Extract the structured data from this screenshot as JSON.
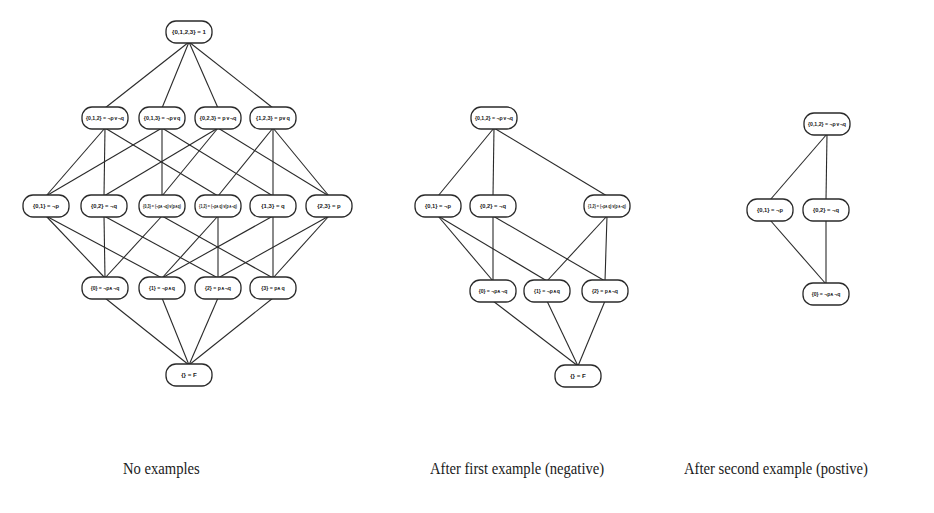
{
  "figure": {
    "captions": [
      {
        "id": "left",
        "text": "No examples",
        "x": 123
      },
      {
        "id": "middle",
        "text": "After first example (negative)",
        "x": 430
      },
      {
        "id": "right",
        "text": "After second example (postive)",
        "x": 684
      }
    ],
    "node_size": {
      "w": 46,
      "h": 22,
      "rx": 10
    },
    "graphs": [
      {
        "id": "no-examples",
        "nodes": [
          {
            "id": "s0123",
            "label": "{0,1,2,3} = 1",
            "x": 189,
            "y": 32
          },
          {
            "id": "s012",
            "label": "{0,1,2} = ¬p∨¬q",
            "x": 105,
            "y": 118
          },
          {
            "id": "s013",
            "label": "{0,1,3} = ¬p∨q",
            "x": 162,
            "y": 118
          },
          {
            "id": "s023",
            "label": "{0,2,3} = p∨¬q",
            "x": 218,
            "y": 118
          },
          {
            "id": "s123",
            "label": "{1,2,3} = p∨q",
            "x": 273,
            "y": 118
          },
          {
            "id": "s01",
            "label": "{0,1} = ¬p",
            "x": 46,
            "y": 206
          },
          {
            "id": "s02",
            "label": "{0,2} = ¬q",
            "x": 104,
            "y": 206
          },
          {
            "id": "s03",
            "label": "{0,3} = (¬p∧¬q)∨(p∧q)",
            "x": 162,
            "y": 206
          },
          {
            "id": "s12",
            "label": "{1,2} = (¬p∧q)∨(p∧¬q)",
            "x": 218,
            "y": 206
          },
          {
            "id": "s13",
            "label": "{1,3} = q",
            "x": 273,
            "y": 206
          },
          {
            "id": "s23",
            "label": "{2,3} = p",
            "x": 329,
            "y": 206
          },
          {
            "id": "s0",
            "label": "{0} = ¬p∧¬q",
            "x": 105,
            "y": 288
          },
          {
            "id": "s1",
            "label": "{1} = ¬p∧q",
            "x": 162,
            "y": 288
          },
          {
            "id": "s2",
            "label": "{2} = p∧¬q",
            "x": 218,
            "y": 288
          },
          {
            "id": "s3",
            "label": "{3} = p∧q",
            "x": 273,
            "y": 288
          },
          {
            "id": "sE",
            "label": "{} = F",
            "x": 189,
            "y": 375
          }
        ],
        "edges": [
          [
            "s0123",
            "s012"
          ],
          [
            "s0123",
            "s013"
          ],
          [
            "s0123",
            "s023"
          ],
          [
            "s0123",
            "s123"
          ],
          [
            "s012",
            "s01"
          ],
          [
            "s012",
            "s02"
          ],
          [
            "s012",
            "s12"
          ],
          [
            "s013",
            "s01"
          ],
          [
            "s013",
            "s03"
          ],
          [
            "s013",
            "s13"
          ],
          [
            "s023",
            "s02"
          ],
          [
            "s023",
            "s03"
          ],
          [
            "s023",
            "s23"
          ],
          [
            "s123",
            "s12"
          ],
          [
            "s123",
            "s13"
          ],
          [
            "s123",
            "s23"
          ],
          [
            "s01",
            "s0"
          ],
          [
            "s01",
            "s1"
          ],
          [
            "s02",
            "s0"
          ],
          [
            "s02",
            "s2"
          ],
          [
            "s03",
            "s0"
          ],
          [
            "s03",
            "s3"
          ],
          [
            "s12",
            "s1"
          ],
          [
            "s12",
            "s2"
          ],
          [
            "s13",
            "s1"
          ],
          [
            "s13",
            "s3"
          ],
          [
            "s23",
            "s2"
          ],
          [
            "s23",
            "s3"
          ],
          [
            "s0",
            "sE"
          ],
          [
            "s1",
            "sE"
          ],
          [
            "s2",
            "sE"
          ],
          [
            "s3",
            "sE"
          ]
        ]
      },
      {
        "id": "after-first-example",
        "nodes": [
          {
            "id": "m012",
            "label": "{0,1,2} = ¬p∨¬q",
            "x": 494,
            "y": 118
          },
          {
            "id": "m01",
            "label": "{0,1} = ¬p",
            "x": 438,
            "y": 206
          },
          {
            "id": "m02",
            "label": "{0,2} = ¬q",
            "x": 493,
            "y": 206
          },
          {
            "id": "m12",
            "label": "{1,2} = (¬p∧q)∨(p∧¬q)",
            "x": 607,
            "y": 206
          },
          {
            "id": "m0",
            "label": "{0} = ¬p∧¬q",
            "x": 493,
            "y": 291
          },
          {
            "id": "m1",
            "label": "{1} = ¬p∧q",
            "x": 547,
            "y": 291
          },
          {
            "id": "m2",
            "label": "{2} = p∧¬q",
            "x": 605,
            "y": 291
          },
          {
            "id": "mE",
            "label": "{} = F",
            "x": 578,
            "y": 376
          }
        ],
        "edges": [
          [
            "m012",
            "m01"
          ],
          [
            "m012",
            "m02"
          ],
          [
            "m012",
            "m12"
          ],
          [
            "m01",
            "m0"
          ],
          [
            "m01",
            "m1"
          ],
          [
            "m02",
            "m0"
          ],
          [
            "m02",
            "m2"
          ],
          [
            "m12",
            "m1"
          ],
          [
            "m12",
            "m2"
          ],
          [
            "m0",
            "mE"
          ],
          [
            "m1",
            "mE"
          ],
          [
            "m2",
            "mE"
          ]
        ]
      },
      {
        "id": "after-second-example",
        "nodes": [
          {
            "id": "r012",
            "label": "{0,1,2} = ¬p∨¬q",
            "x": 827,
            "y": 124
          },
          {
            "id": "r01",
            "label": "{0,1} = ¬p",
            "x": 770,
            "y": 210
          },
          {
            "id": "r02",
            "label": "{0,2} = ¬q",
            "x": 826,
            "y": 210
          },
          {
            "id": "r0",
            "label": "{0} = ¬p∧¬q",
            "x": 826,
            "y": 294
          }
        ],
        "edges": [
          [
            "r012",
            "r01"
          ],
          [
            "r012",
            "r02"
          ],
          [
            "r01",
            "r0"
          ],
          [
            "r02",
            "r0"
          ]
        ]
      }
    ]
  }
}
